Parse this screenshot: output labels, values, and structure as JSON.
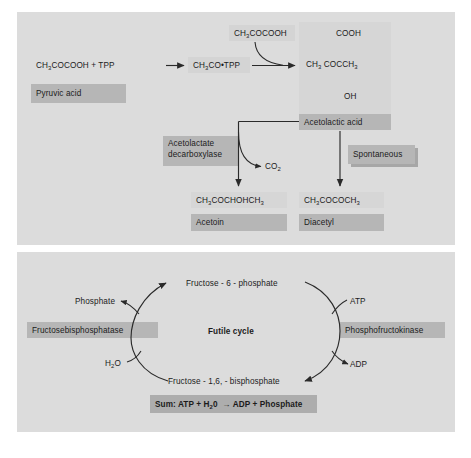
{
  "figure": {
    "panels": [
      {
        "id": "acetolactate-pathway",
        "nodes": {
          "pyruvate_tpp": "CH3COCOOH + TPP",
          "pyruvate_tpp_label": "Pyruvic acid",
          "hydroxyethyl_tpp": "CH3CO•TPP",
          "pyruvate_second": "CH3COCOOH",
          "acetolactate_top": "COOH",
          "acetolactate_mid_left": "CH3",
          "acetolactate_mid_right": "COCCH3",
          "acetolactate_bottom": "OH",
          "acetolactate_label": "Acetolactic acid",
          "enzyme_line1": "Acetolactate",
          "enzyme_line2": "decarboxylase",
          "co2": "CO2",
          "spontaneous": "Spontaneous",
          "acetoin_formula": "CH3COCHOHCH3",
          "acetoin_label": "Acetoin",
          "diacetyl_formula": "CH3COCOCH3",
          "diacetyl_label": "Diacetyl"
        }
      },
      {
        "id": "futile-cycle",
        "nodes": {
          "fructose6p": "Fructose - 6 - phosphate",
          "fructose16bp": "Fructose - 1,6, - bisphosphate",
          "center_title": "Futile cycle",
          "phosphate": "Phosphate",
          "water": "H2O",
          "atp": "ATP",
          "adp": "ADP",
          "enzyme_left": "Fructosebisphosphatase",
          "enzyme_right": "Phosphofructokinase",
          "sum_line": "Sum: ATP + H20  → ADP + Phosphate"
        }
      }
    ],
    "colors": {
      "panel_background": "#dcdcdc",
      "highlight_band": "#b6b6b6",
      "text": "#1b1b1b",
      "stroke": "#2a2a2a",
      "page_background": "#ffffff"
    }
  }
}
